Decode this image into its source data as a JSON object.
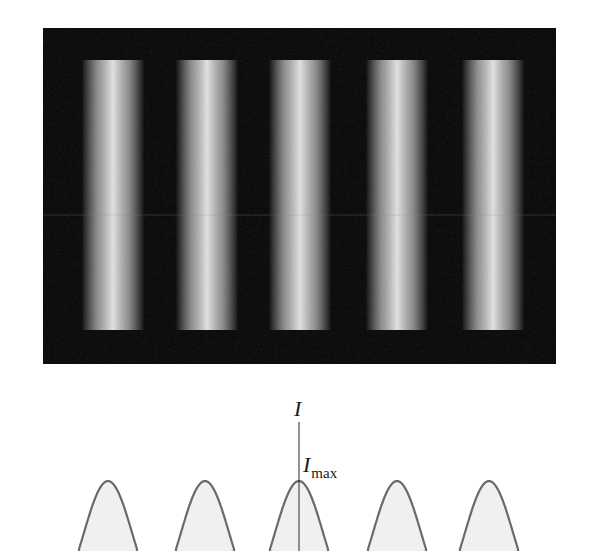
{
  "figure": {
    "photo": {
      "description": "Double-slit interference fringe photograph",
      "fringe_count": 5,
      "fringe_centers_px": [
        112,
        207,
        300,
        397,
        493
      ],
      "background_color": "#121212",
      "fringe_color": "#dcdcdc"
    },
    "graph": {
      "y_axis_label": "I",
      "peak_label_main": "I",
      "peak_label_sub": "max",
      "curve_stroke": "#6a6a6a",
      "curve_fill": "#f0f0f0"
    }
  },
  "chart_data": {
    "type": "line",
    "title": "",
    "xlabel": "",
    "ylabel": "I",
    "annotations": [
      "I_max"
    ],
    "series": [
      {
        "name": "Intensity (cos² profile)",
        "peak_positions_px": [
          108,
          205,
          299,
          397,
          489
        ],
        "peak_value": "I_max",
        "period_px": 96
      }
    ],
    "grid": false
  }
}
